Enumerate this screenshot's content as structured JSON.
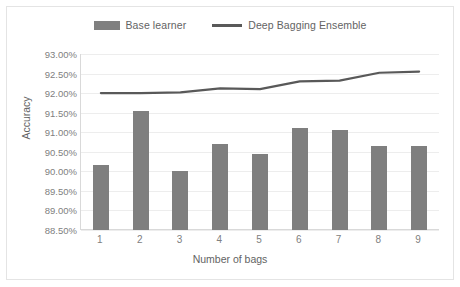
{
  "chart_data": {
    "type": "bar",
    "title": "",
    "xlabel": "Number of bags",
    "ylabel": "Accuracy",
    "categories": [
      "1",
      "2",
      "3",
      "4",
      "5",
      "6",
      "7",
      "8",
      "9"
    ],
    "ylim": [
      88.5,
      93.0
    ],
    "ytick_step": 0.5,
    "ytick_labels": [
      "93.00%",
      "92.50%",
      "92.00%",
      "91.50%",
      "91.00%",
      "90.50%",
      "90.00%",
      "89.50%",
      "89.00%",
      "88.50%"
    ],
    "ytick_values": [
      93.0,
      92.5,
      92.0,
      91.5,
      91.0,
      90.5,
      90.0,
      89.5,
      89.0,
      88.5
    ],
    "grid": true,
    "legend_position": "top-center",
    "series": [
      {
        "name": "Base learner",
        "type": "bar",
        "color": "#7f7f7f",
        "values": [
          90.15,
          91.55,
          90.0,
          90.7,
          90.45,
          91.1,
          91.05,
          90.65,
          90.65
        ]
      },
      {
        "name": "Deep Bagging Ensemble",
        "type": "line",
        "color": "#595959",
        "values": [
          92.0,
          92.0,
          92.02,
          92.12,
          92.1,
          92.3,
          92.32,
          92.52,
          92.55
        ]
      }
    ]
  },
  "legend": {
    "items": [
      {
        "label": "Base learner",
        "marker": "bar-swatch"
      },
      {
        "label": "Deep Bagging Ensemble",
        "marker": "line-swatch"
      }
    ]
  }
}
